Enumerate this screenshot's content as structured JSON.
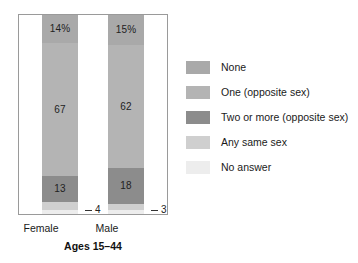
{
  "caption": "Ages 15–44",
  "axis": {
    "categories": [
      "Female",
      "Male"
    ]
  },
  "legend": {
    "items": [
      {
        "label": "None",
        "color": "#a9a9a9"
      },
      {
        "label": "One (opposite sex)",
        "color": "#b4b4b4"
      },
      {
        "label": "Two or more (opposite sex)",
        "color": "#8c8c8c"
      },
      {
        "label": "Any same sex",
        "color": "#cfcfcf"
      },
      {
        "label": "No answer",
        "color": "#ededed"
      }
    ]
  },
  "bars": {
    "female": {
      "category": "Female",
      "segments": [
        {
          "series": "None",
          "value": 14,
          "label": "14%",
          "color": "#a9a9a9",
          "label_visible": true
        },
        {
          "series": "One (opposite sex)",
          "value": 67,
          "label": "67",
          "color": "#b4b4b4",
          "label_visible": true
        },
        {
          "series": "Two or more (opposite sex)",
          "value": 13,
          "label": "13",
          "color": "#8c8c8c",
          "label_visible": true
        },
        {
          "series": "Any same sex",
          "value": 4,
          "label": "4",
          "color": "#cfcfcf",
          "label_visible": false
        },
        {
          "series": "No answer",
          "value": 2,
          "label": "",
          "color": "#ededed",
          "label_visible": false
        }
      ],
      "callout": "4"
    },
    "male": {
      "category": "Male",
      "segments": [
        {
          "series": "None",
          "value": 15,
          "label": "15%",
          "color": "#a9a9a9",
          "label_visible": true
        },
        {
          "series": "One (opposite sex)",
          "value": 62,
          "label": "62",
          "color": "#b4b4b4",
          "label_visible": true
        },
        {
          "series": "Two or more (opposite sex)",
          "value": 18,
          "label": "18",
          "color": "#8c8c8c",
          "label_visible": true
        },
        {
          "series": "Any same sex",
          "value": 3,
          "label": "3",
          "color": "#cfcfcf",
          "label_visible": false
        },
        {
          "series": "No answer",
          "value": 2,
          "label": "",
          "color": "#ededed",
          "label_visible": false
        }
      ],
      "callout": "3"
    }
  },
  "chart_data": {
    "type": "bar",
    "subtype": "stacked-100-percent",
    "title": "",
    "subtitle": "",
    "xlabel": "Ages 15–44",
    "ylabel": "",
    "ylim": [
      0,
      100
    ],
    "grid": false,
    "legend_position": "right",
    "categories": [
      "Female",
      "Male"
    ],
    "series": [
      {
        "name": "None",
        "values": [
          14,
          15
        ],
        "color": "#a9a9a9"
      },
      {
        "name": "One (opposite sex)",
        "values": [
          67,
          62
        ],
        "color": "#b4b4b4"
      },
      {
        "name": "Two or more (opposite sex)",
        "values": [
          13,
          18
        ],
        "color": "#8c8c8c"
      },
      {
        "name": "Any same sex",
        "values": [
          4,
          3
        ],
        "color": "#cfcfcf"
      },
      {
        "name": "No answer",
        "values": [
          2,
          2
        ],
        "color": "#ededed"
      }
    ],
    "data_labels": {
      "Female": [
        "14%",
        "67",
        "13",
        "4",
        ""
      ],
      "Male": [
        "15%",
        "62",
        "18",
        "3",
        ""
      ]
    },
    "annotations": [
      {
        "text": "4",
        "attached_to": "Female / Any same sex",
        "style": "leader-line"
      },
      {
        "text": "3",
        "attached_to": "Male / Any same sex",
        "style": "leader-line"
      }
    ],
    "units": "percent"
  }
}
